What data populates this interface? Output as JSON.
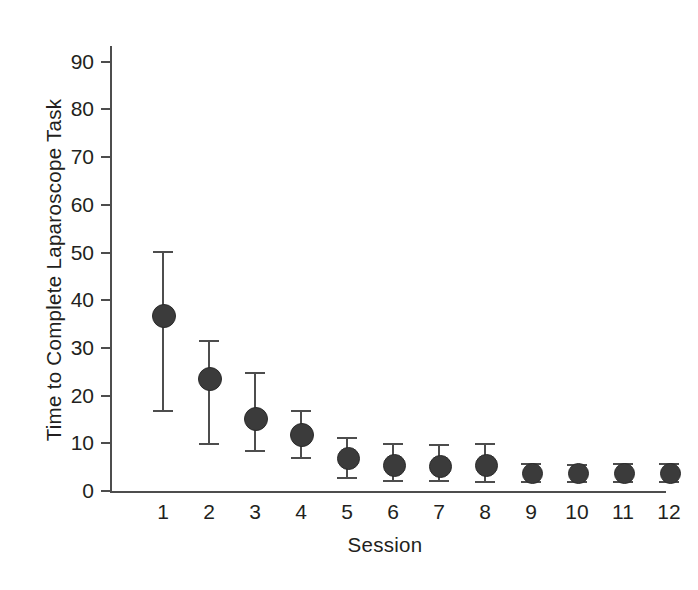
{
  "chart_data": {
    "type": "scatter",
    "title": "",
    "xlabel": "Session",
    "ylabel": "Time to Complete Laparoscope Task",
    "categories": [
      "1",
      "2",
      "3",
      "4",
      "5",
      "6",
      "7",
      "8",
      "9",
      "10",
      "11",
      "12"
    ],
    "x": [
      1,
      2,
      3,
      4,
      5,
      6,
      7,
      8,
      9,
      10,
      11,
      12
    ],
    "values": [
      36.8,
      23.6,
      15.2,
      12.0,
      7.0,
      5.5,
      5.4,
      5.5,
      3.9,
      3.8,
      3.9,
      3.9
    ],
    "error_low": [
      17.0,
      10.0,
      8.6,
      7.2,
      3.0,
      2.4,
      2.4,
      2.2,
      2.2,
      2.0,
      2.2,
      2.2
    ],
    "error_high": [
      50.3,
      31.6,
      25.0,
      17.0,
      11.4,
      10.0,
      9.9,
      10.0,
      5.9,
      5.7,
      5.9,
      5.9
    ],
    "ylim": [
      0,
      94
    ],
    "xlim": [
      0.4,
      12.6
    ],
    "yticks": [
      0,
      10,
      20,
      30,
      40,
      50,
      60,
      70,
      80,
      90
    ],
    "ytick_labels": [
      "0",
      "10",
      "20",
      "30",
      "40",
      "50",
      "60",
      "70",
      "80",
      "90"
    ],
    "xtick_labels": [
      "1",
      "2",
      "3",
      "4",
      "5",
      "6",
      "7",
      "8",
      "9",
      "10",
      "11",
      "12"
    ],
    "grid": false,
    "legend": "none",
    "marker_color": "#3b3b3b",
    "errorbar_color": "#4d4d4d",
    "axis_color": "#4d4d4d",
    "text_color": "#231f20",
    "background": "#ffffff"
  }
}
